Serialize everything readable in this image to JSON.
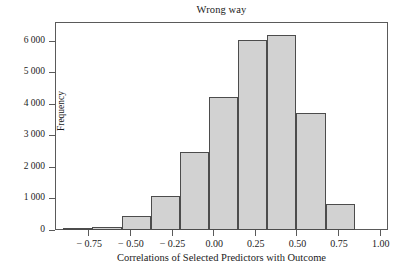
{
  "chart_data": {
    "type": "bar",
    "title": "Wrong way",
    "xlabel": "Correlations of Selected Predictors with Outcome",
    "ylabel": "Frequency",
    "grid": false,
    "legend": null,
    "xlim": [
      -0.95,
      1.05
    ],
    "ylim": [
      0,
      6600
    ],
    "bin_width": 0.175,
    "x_tick_values": [
      -0.75,
      -0.5,
      -0.25,
      0.0,
      0.25,
      0.5,
      0.75,
      1.0
    ],
    "x_tick_labels": [
      "− 0.75",
      "− 0.50",
      "− 0.25",
      "0.00",
      "0.25",
      "0.50",
      "0.75",
      "1.00"
    ],
    "y_tick_values": [
      0,
      1000,
      2000,
      3000,
      4000,
      5000,
      6000
    ],
    "y_tick_labels": [
      "0",
      "1 000",
      "2 000",
      "3 000",
      "4 000",
      "5 000",
      "6 000"
    ],
    "bins": [
      {
        "x_start": -0.9,
        "x_end": -0.725,
        "value": 30
      },
      {
        "x_start": -0.725,
        "x_end": -0.55,
        "value": 100
      },
      {
        "x_start": -0.55,
        "x_end": -0.375,
        "value": 430
      },
      {
        "x_start": -0.375,
        "x_end": -0.2,
        "value": 1070
      },
      {
        "x_start": -0.2,
        "x_end": -0.025,
        "value": 2490
      },
      {
        "x_start": -0.025,
        "x_end": 0.15,
        "value": 4230
      },
      {
        "x_start": 0.15,
        "x_end": 0.325,
        "value": 6030
      },
      {
        "x_start": 0.325,
        "x_end": 0.5,
        "value": 6200
      },
      {
        "x_start": 0.5,
        "x_end": 0.675,
        "value": 3700
      },
      {
        "x_start": 0.675,
        "x_end": 0.85,
        "value": 830
      },
      {
        "x_start": 0.85,
        "x_end": 0.95,
        "value": 0
      }
    ],
    "categories": [
      "-0.90",
      "-0.725",
      "-0.55",
      "-0.375",
      "-0.20",
      "-0.025",
      "0.15",
      "0.325",
      "0.50",
      "0.675",
      "0.85"
    ],
    "values": [
      30,
      100,
      430,
      1070,
      2490,
      4230,
      6030,
      6200,
      3700,
      830,
      0
    ],
    "colors": {
      "bar_fill": "#d2d2d2",
      "bar_edge": "#4c4c4c",
      "axis": "#5a5a5a",
      "text": "#1b1b1b",
      "background": "#ffffff"
    }
  }
}
